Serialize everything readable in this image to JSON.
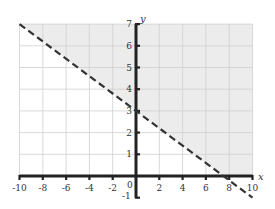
{
  "chart_data": {
    "type": "line",
    "title": "",
    "xlabel": "x",
    "ylabel": "y",
    "xlim": [
      -10,
      10
    ],
    "ylim": [
      -1,
      7
    ],
    "x_ticks": [
      -10,
      -8,
      -6,
      -4,
      -2,
      2,
      4,
      6,
      8,
      10
    ],
    "x_tick_labels": [
      "-10",
      "-8",
      "-6",
      "-4",
      "-2",
      "2",
      "4",
      "6",
      "8",
      "10"
    ],
    "y_ticks": [
      1,
      2,
      3,
      4,
      5,
      6,
      7
    ],
    "y_tick_labels": [
      "1",
      "2",
      "3",
      "4",
      "5",
      "6",
      "7"
    ],
    "y_negative_label": "-1",
    "origin_label": "0",
    "grid": true,
    "grid_x_step": 2,
    "grid_y_step": 1,
    "series": [
      {
        "name": "boundary line y = -0.4x + 3",
        "style": "dashed",
        "x": [
          -10,
          10
        ],
        "y": [
          7,
          -1
        ]
      }
    ],
    "shaded_region": {
      "description": "region above the dashed line (y > -0.4x + 3), within the graph window",
      "polygon": [
        [
          -10,
          7
        ],
        [
          10,
          7
        ],
        [
          10,
          0
        ],
        [
          7.5,
          0
        ]
      ]
    },
    "inequality": "y > -0.4x + 3",
    "colors": {
      "shade": "#ececec",
      "grid": "#cfcfcf",
      "axis": "#222222",
      "line": "#333333"
    }
  }
}
